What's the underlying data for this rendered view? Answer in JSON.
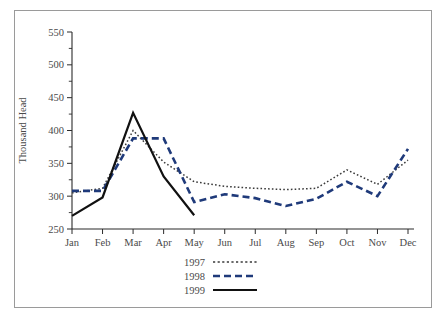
{
  "chart_data": {
    "type": "line",
    "title": "",
    "xlabel": "",
    "ylabel": "Thousand Head",
    "categories": [
      "Jan",
      "Feb",
      "Mar",
      "Apr",
      "May",
      "Jun",
      "Jul",
      "Aug",
      "Sep",
      "Oct",
      "Nov",
      "Dec"
    ],
    "ylim": [
      250,
      550
    ],
    "ytick_step": 50,
    "yticks": [
      250,
      300,
      350,
      400,
      450,
      500,
      550
    ],
    "yticklabels": [
      "250",
      "300",
      "350",
      "400",
      "450",
      "500",
      "550"
    ],
    "minor_tick_step": 25,
    "grid": false,
    "legend_position": "below-axes-center",
    "series": [
      {
        "name": "1997",
        "style": "dotted",
        "color": "#3a3a3a",
        "values": [
          305,
          312,
          400,
          352,
          322,
          315,
          312,
          310,
          312,
          340,
          318,
          355
        ]
      },
      {
        "name": "1998",
        "style": "dashed",
        "color": "#1f3a7a",
        "values": [
          308,
          308,
          388,
          388,
          291,
          303,
          297,
          285,
          296,
          322,
          300,
          372
        ]
      },
      {
        "name": "1999",
        "style": "solid",
        "color": "#111111",
        "values": [
          270,
          298,
          427,
          330,
          271,
          null,
          null,
          null,
          null,
          null,
          null,
          null
        ]
      }
    ]
  },
  "legend": {
    "entries": [
      {
        "label": "1997",
        "style": "dotted",
        "color": "#3a3a3a"
      },
      {
        "label": "1998",
        "style": "dashed",
        "color": "#1f3a7a"
      },
      {
        "label": "1999",
        "style": "solid",
        "color": "#111111"
      }
    ]
  },
  "axes": {
    "y_title": "Thousand Head"
  }
}
